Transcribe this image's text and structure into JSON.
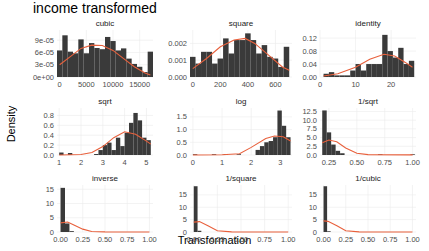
{
  "title": "income transformed",
  "xlabel": "Transformation",
  "ylabel": "Density",
  "colors": {
    "bar": "#3a3a3a",
    "curve": "#e8603c",
    "grid": "#ebebeb",
    "axis_text": "#4d4d4d"
  },
  "chart_data": [
    {
      "type": "bar",
      "title": "cubic",
      "xlim": [
        -500,
        17500
      ],
      "ylim": [
        0,
        0.000115
      ],
      "xticks": [
        0,
        5000,
        10000,
        15000
      ],
      "xtick_labels": [
        "0",
        "5000",
        "10000",
        "15000"
      ],
      "yticks": [
        0,
        3e-05,
        6e-05,
        9e-05
      ],
      "ytick_labels": [
        "0e+00",
        "3e-05",
        "6e-05",
        "9e-05"
      ],
      "bins": [
        [
          -500,
          500,
          6.5e-05
        ],
        [
          500,
          1500,
          0.000102
        ],
        [
          1500,
          2500,
          6.2e-05
        ],
        [
          2500,
          3500,
          5.8e-05
        ],
        [
          3500,
          4500,
          9.2e-05
        ],
        [
          4500,
          5500,
          5.8e-05
        ],
        [
          5500,
          6500,
          8.3e-05
        ],
        [
          6500,
          7500,
          7.1e-05
        ],
        [
          7500,
          8500,
          6.8e-05
        ],
        [
          8500,
          9500,
          9.8e-05
        ],
        [
          9500,
          10500,
          8.8e-05
        ],
        [
          10500,
          11500,
          6.5e-05
        ],
        [
          11500,
          12500,
          7e-05
        ],
        [
          12500,
          13500,
          4.5e-05
        ],
        [
          13500,
          14500,
          3.2e-05
        ],
        [
          14500,
          15500,
          2.5e-05
        ],
        [
          15500,
          16500,
          1.2e-05
        ],
        [
          16500,
          17500,
          6.2e-05
        ]
      ],
      "curve": [
        [
          0,
          3e-05
        ],
        [
          2000,
          5e-05
        ],
        [
          4000,
          7e-05
        ],
        [
          6000,
          7.8e-05
        ],
        [
          8000,
          7.7e-05
        ],
        [
          10000,
          6.5e-05
        ],
        [
          12000,
          4.5e-05
        ],
        [
          14000,
          2.5e-05
        ],
        [
          16000,
          1e-05
        ],
        [
          17000,
          5e-06
        ]
      ]
    },
    {
      "type": "bar",
      "title": "square",
      "xlim": [
        -20,
        720
      ],
      "ylim": [
        0,
        0.0028
      ],
      "xticks": [
        0,
        200,
        400,
        600
      ],
      "xtick_labels": [
        "0",
        "200",
        "400",
        "600"
      ],
      "yticks": [
        0,
        0.001,
        0.002
      ],
      "ytick_labels": [
        "0.000",
        "0.001",
        "0.002"
      ],
      "bins": [
        [
          -20,
          20,
          0.0012
        ],
        [
          20,
          60,
          0.0008
        ],
        [
          60,
          100,
          0.0015
        ],
        [
          100,
          140,
          0.0015
        ],
        [
          140,
          180,
          0.0008
        ],
        [
          180,
          220,
          0.0011
        ],
        [
          220,
          260,
          0.0023
        ],
        [
          260,
          300,
          0.0014
        ],
        [
          300,
          340,
          0.0022
        ],
        [
          340,
          380,
          0.0022
        ],
        [
          380,
          420,
          0.0026
        ],
        [
          420,
          460,
          0.0022
        ],
        [
          460,
          500,
          0.0014
        ],
        [
          500,
          540,
          0.0019
        ],
        [
          540,
          580,
          0.0012
        ],
        [
          580,
          620,
          0.0011
        ],
        [
          620,
          660,
          0.0006
        ],
        [
          660,
          700,
          0.0018
        ]
      ],
      "curve": [
        [
          0,
          0.0005
        ],
        [
          100,
          0.0011
        ],
        [
          200,
          0.0018
        ],
        [
          300,
          0.0022
        ],
        [
          380,
          0.0023
        ],
        [
          450,
          0.002
        ],
        [
          550,
          0.0013
        ],
        [
          650,
          0.0006
        ],
        [
          700,
          0.0004
        ]
      ]
    },
    {
      "type": "bar",
      "title": "identity",
      "xlim": [
        0,
        27
      ],
      "ylim": [
        0,
        0.145
      ],
      "xticks": [
        0,
        10,
        20
      ],
      "xtick_labels": [
        "0",
        "10",
        "20"
      ],
      "yticks": [
        0,
        0.04,
        0.08,
        0.12
      ],
      "ytick_labels": [
        "0.00",
        "0.04",
        "0.08",
        "0.12"
      ],
      "bins": [
        [
          1,
          2.5,
          0.01
        ],
        [
          2.5,
          4,
          0.015
        ],
        [
          4,
          5.5,
          0.005
        ],
        [
          5.5,
          7,
          0.005
        ],
        [
          7,
          8.5,
          0.005
        ],
        [
          8.5,
          10,
          0.02
        ],
        [
          10,
          11.5,
          0.04
        ],
        [
          11.5,
          13,
          0.02
        ],
        [
          13,
          14.5,
          0.04
        ],
        [
          14.5,
          16,
          0.04
        ],
        [
          16,
          17.5,
          0.04
        ],
        [
          17.5,
          19,
          0.13
        ],
        [
          19,
          20.5,
          0.08
        ],
        [
          20.5,
          22,
          0.06
        ],
        [
          22,
          23.5,
          0.09
        ],
        [
          23.5,
          25,
          0.04
        ],
        [
          25,
          26.5,
          0.05
        ]
      ],
      "curve": [
        [
          1,
          0.003
        ],
        [
          5,
          0.01
        ],
        [
          10,
          0.03
        ],
        [
          14,
          0.055
        ],
        [
          18,
          0.07
        ],
        [
          21,
          0.065
        ],
        [
          24,
          0.045
        ],
        [
          26,
          0.03
        ]
      ]
    },
    {
      "type": "bar",
      "title": "sqrt",
      "xlim": [
        0.9,
        5.3
      ],
      "ylim": [
        0,
        0.95
      ],
      "xticks": [
        1,
        2,
        3,
        4,
        5
      ],
      "xtick_labels": [
        "1",
        "2",
        "3",
        "4",
        "5"
      ],
      "yticks": [
        0,
        0.2,
        0.4,
        0.6,
        0.8
      ],
      "ytick_labels": [
        "0.0",
        "0.2",
        "0.4",
        "0.6",
        "0.8"
      ],
      "bins": [
        [
          1.0,
          1.2,
          0.05
        ],
        [
          1.4,
          1.6,
          0.04
        ],
        [
          2.6,
          2.8,
          0.02
        ],
        [
          2.8,
          3.0,
          0.1
        ],
        [
          3.0,
          3.2,
          0.2
        ],
        [
          3.2,
          3.4,
          0.25
        ],
        [
          3.4,
          3.6,
          0.1
        ],
        [
          3.6,
          3.8,
          0.35
        ],
        [
          3.8,
          4.0,
          0.18
        ],
        [
          4.0,
          4.2,
          0.45
        ],
        [
          4.2,
          4.4,
          0.65
        ],
        [
          4.4,
          4.6,
          0.85
        ],
        [
          4.6,
          4.8,
          0.7
        ],
        [
          4.8,
          5.0,
          0.35
        ],
        [
          5.0,
          5.2,
          0.3
        ]
      ],
      "curve": [
        [
          1,
          0
        ],
        [
          2,
          0.01
        ],
        [
          2.5,
          0.05
        ],
        [
          3,
          0.17
        ],
        [
          3.5,
          0.35
        ],
        [
          4,
          0.47
        ],
        [
          4.5,
          0.42
        ],
        [
          5,
          0.28
        ],
        [
          5.2,
          0.22
        ]
      ]
    },
    {
      "type": "bar",
      "title": "log",
      "xlim": [
        -0.1,
        3.4
      ],
      "ylim": [
        0,
        1.85
      ],
      "xticks": [
        0,
        1,
        2,
        3
      ],
      "xtick_labels": [
        "0",
        "1",
        "2",
        "3"
      ],
      "yticks": [
        0,
        0.5,
        1.0,
        1.5
      ],
      "ytick_labels": [
        "0.0",
        "0.5",
        "1.0",
        "1.5"
      ],
      "bins": [
        [
          0,
          0.15,
          0.03
        ],
        [
          0.65,
          0.8,
          0.03
        ],
        [
          1.05,
          1.2,
          0.03
        ],
        [
          1.5,
          1.65,
          0.03
        ],
        [
          2.15,
          2.3,
          0.2
        ],
        [
          2.3,
          2.45,
          0.35
        ],
        [
          2.45,
          2.6,
          0.5
        ],
        [
          2.6,
          2.75,
          0.55
        ],
        [
          2.75,
          2.9,
          0.7
        ],
        [
          2.9,
          3.05,
          1.75
        ],
        [
          3.05,
          3.2,
          1.15
        ],
        [
          3.2,
          3.35,
          0.7
        ]
      ],
      "curve": [
        [
          0,
          0
        ],
        [
          1,
          0.01
        ],
        [
          1.6,
          0.05
        ],
        [
          2,
          0.3
        ],
        [
          2.5,
          0.65
        ],
        [
          2.8,
          0.75
        ],
        [
          3.1,
          0.72
        ],
        [
          3.35,
          0.55
        ]
      ]
    },
    {
      "type": "bar",
      "title": "1/sqrt",
      "xlim": [
        0.17,
        1.03
      ],
      "ylim": [
        0,
        13.5
      ],
      "xticks": [
        0.25,
        0.5,
        0.75,
        1.0
      ],
      "xtick_labels": [
        "0.25",
        "0.50",
        "0.75",
        "1.00"
      ],
      "yticks": [
        0,
        2.5,
        5.0,
        7.5,
        10.0,
        12.5
      ],
      "ytick_labels": [
        "0.0",
        "2.5",
        "5.0",
        "7.5",
        "10.0",
        "12.5"
      ],
      "bins": [
        [
          0.19,
          0.23,
          12.8
        ],
        [
          0.23,
          0.27,
          6.5
        ],
        [
          0.27,
          0.31,
          3.0
        ],
        [
          0.31,
          0.35,
          1.2
        ],
        [
          0.35,
          0.39,
          0.5
        ],
        [
          0.69,
          0.73,
          0.2
        ],
        [
          0.98,
          1.02,
          0.2
        ]
      ],
      "curve": [
        [
          0.19,
          3.5
        ],
        [
          0.25,
          4.3
        ],
        [
          0.32,
          3.8
        ],
        [
          0.4,
          2.0
        ],
        [
          0.5,
          0.5
        ],
        [
          0.6,
          0.1
        ],
        [
          1.0,
          0.05
        ]
      ]
    },
    {
      "type": "bar",
      "title": "inverse",
      "xlim": [
        -0.04,
        1.04
      ],
      "ylim": [
        0,
        16.5
      ],
      "xticks": [
        0,
        0.25,
        0.5,
        0.75,
        1.0
      ],
      "xtick_labels": [
        "0.00",
        "0.25",
        "0.50",
        "0.75",
        "1.00"
      ],
      "yticks": [
        0,
        5,
        10,
        15
      ],
      "ytick_labels": [
        "0",
        "5",
        "10",
        "15"
      ],
      "bins": [
        [
          0.0,
          0.05,
          15.5
        ],
        [
          0.05,
          0.1,
          3.0
        ],
        [
          0.1,
          0.15,
          0.3
        ]
      ],
      "curve": [
        [
          0,
          3.2
        ],
        [
          0.08,
          3.5
        ],
        [
          0.15,
          2.5
        ],
        [
          0.25,
          1.0
        ],
        [
          0.35,
          0.2
        ],
        [
          0.5,
          0.05
        ],
        [
          1.0,
          0.02
        ]
      ]
    },
    {
      "type": "bar",
      "title": "1/square",
      "xlim": [
        -0.04,
        1.04
      ],
      "ylim": [
        0,
        19
      ],
      "xticks": [
        0,
        0.25,
        0.5,
        0.75,
        1.0
      ],
      "xtick_labels": [
        "0.00",
        "0.25",
        "0.50",
        "0.75",
        "1.00"
      ],
      "yticks": [
        0,
        5,
        10,
        15
      ],
      "ytick_labels": [
        "0",
        "5",
        "10",
        "15"
      ],
      "bins": [
        [
          0.0,
          0.04,
          18.5
        ],
        [
          0.04,
          0.08,
          0.5
        ]
      ],
      "curve": [
        [
          0,
          4.0
        ],
        [
          0.06,
          4.2
        ],
        [
          0.15,
          2.5
        ],
        [
          0.25,
          0.5
        ],
        [
          0.4,
          0.05
        ],
        [
          1.0,
          0.02
        ]
      ]
    },
    {
      "type": "bar",
      "title": "1/cubic",
      "xlim": [
        -0.04,
        1.04
      ],
      "ylim": [
        0,
        19
      ],
      "xticks": [
        0,
        0.25,
        0.5,
        0.75,
        1.0
      ],
      "xtick_labels": [
        "0.00",
        "0.25",
        "0.50",
        "0.75",
        "1.00"
      ],
      "yticks": [
        0,
        5,
        10,
        15
      ],
      "ytick_labels": [
        "0",
        "5",
        "10",
        "15"
      ],
      "bins": [
        [
          0.0,
          0.04,
          18.5
        ],
        [
          0.04,
          0.08,
          0.3
        ]
      ],
      "curve": [
        [
          0,
          4.5
        ],
        [
          0.05,
          4.3
        ],
        [
          0.15,
          2.5
        ],
        [
          0.25,
          0.5
        ],
        [
          0.4,
          0.05
        ],
        [
          1.0,
          0.02
        ]
      ]
    }
  ]
}
